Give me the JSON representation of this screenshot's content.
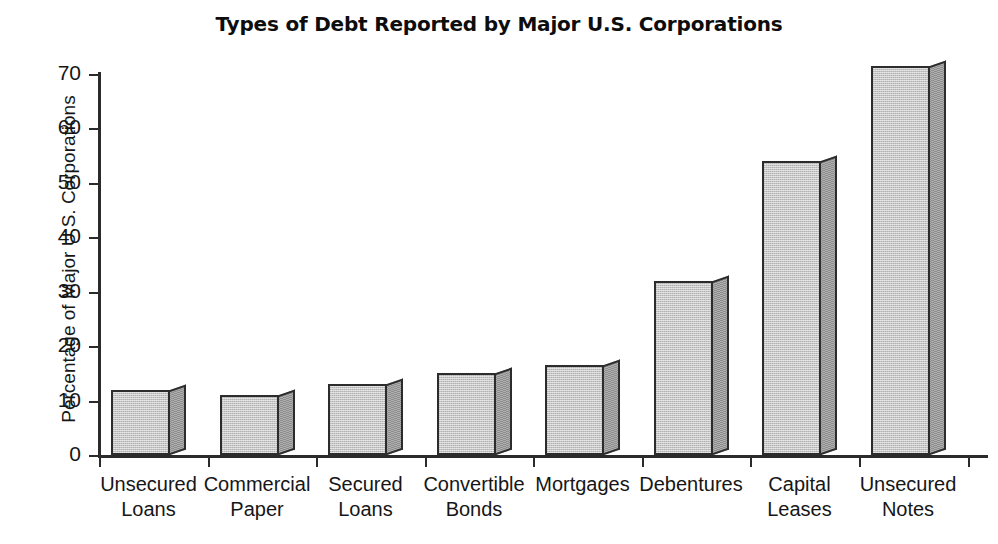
{
  "chart_data": {
    "type": "bar",
    "title": "Types of Debt Reported by Major U.S. Corporations",
    "xlabel": "",
    "ylabel": "Percentage of Major U.S. Corporations",
    "categories": [
      "Unsecured\nLoans",
      "Commercial\nPaper",
      "Secured\nLoans",
      "Convertible\nBonds",
      "Mortgages",
      "Debentures",
      "Capital\nLeases",
      "Unsecured\nNotes"
    ],
    "values": [
      12,
      11,
      13,
      15,
      16.5,
      32,
      54,
      71.5
    ],
    "ylim": [
      0,
      70
    ],
    "yticks": [
      0,
      10,
      20,
      30,
      40,
      50,
      60,
      70
    ],
    "ytick_labels": [
      "0",
      "10",
      "20",
      "30",
      "40",
      "50",
      "60",
      "70"
    ],
    "grid": false,
    "legend": "none",
    "bar_face_color": "#c6c6c6",
    "bar_side_color": "#8d8d8d",
    "axis_color": "#2b2b2b",
    "background_color": "#ffffff"
  }
}
